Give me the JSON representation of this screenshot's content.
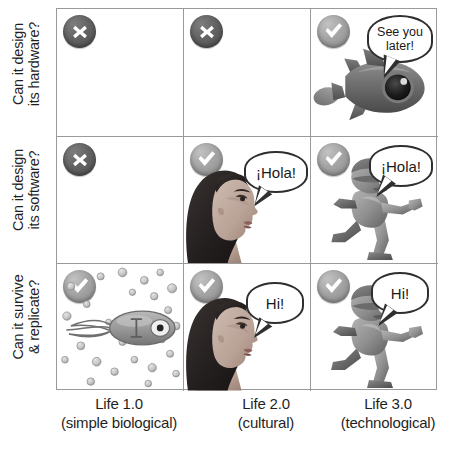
{
  "figure": {
    "background_color": "#ffffff",
    "grid_line_color": "#9a9a9a"
  },
  "rows": [
    {
      "id": "hardware",
      "label_line1": "Can it design",
      "label_line2": "its hardware?"
    },
    {
      "id": "software",
      "label_line1": "Can it design",
      "label_line2": "its software?"
    },
    {
      "id": "survive",
      "label_line1": "Can it survive",
      "label_line2": "& replicate?"
    }
  ],
  "columns": [
    {
      "id": "life1",
      "label_line1": "Life 1.0",
      "label_line2": "(simple biological)"
    },
    {
      "id": "life2",
      "label_line1": "Life 2.0",
      "label_line2": "(cultural)"
    },
    {
      "id": "life3",
      "label_line1": "Life 3.0",
      "label_line2": "(technological)"
    }
  ],
  "cells": [
    {
      "row": "hardware",
      "column": "life1",
      "status": "no",
      "status_icon": "cross-circle-icon",
      "illustration": "none",
      "speech": null
    },
    {
      "row": "hardware",
      "column": "life2",
      "status": "no",
      "status_icon": "cross-circle-icon",
      "illustration": "none",
      "speech": null
    },
    {
      "row": "hardware",
      "column": "life3",
      "status": "yes",
      "status_icon": "check-circle-icon",
      "illustration": "rocket",
      "speech": "See you later!"
    },
    {
      "row": "software",
      "column": "life1",
      "status": "no",
      "status_icon": "cross-circle-icon",
      "illustration": "none",
      "speech": null
    },
    {
      "row": "software",
      "column": "life2",
      "status": "yes",
      "status_icon": "check-circle-icon",
      "illustration": "woman-profile",
      "speech": "¡Hola!"
    },
    {
      "row": "software",
      "column": "life3",
      "status": "yes",
      "status_icon": "check-circle-icon",
      "illustration": "robot-running",
      "speech": "¡Hola!"
    },
    {
      "row": "survive",
      "column": "life1",
      "status": "yes",
      "status_icon": "check-circle-icon",
      "illustration": "bacterium",
      "speech": null
    },
    {
      "row": "survive",
      "column": "life2",
      "status": "yes",
      "status_icon": "check-circle-icon",
      "illustration": "woman-profile",
      "speech": "Hi!"
    },
    {
      "row": "survive",
      "column": "life3",
      "status": "yes",
      "status_icon": "check-circle-icon",
      "illustration": "robot-running",
      "speech": "Hi!"
    }
  ],
  "colors": {
    "badge_no": "#5a5a5a",
    "badge_yes": "#a4a4a4",
    "badge_mark": "#ffffff",
    "bubble_outline": "#2f2f2f",
    "text": "#1f1f1f"
  }
}
